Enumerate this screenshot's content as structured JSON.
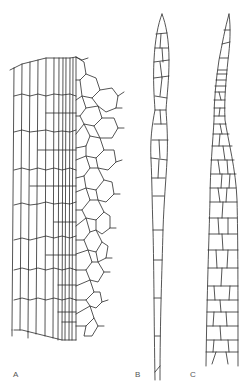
{
  "figure": {
    "panels": [
      {
        "id": "A",
        "label": "A",
        "description": "cell network section, elongated cells left, polygonal cells right"
      },
      {
        "id": "B",
        "label": "B",
        "description": "narrow pointed filament of cells"
      },
      {
        "id": "C",
        "label": "C",
        "description": "wider pointed filament of polygonal cells"
      }
    ],
    "line_color": "#2a2a2a",
    "background": "#ffffff"
  }
}
